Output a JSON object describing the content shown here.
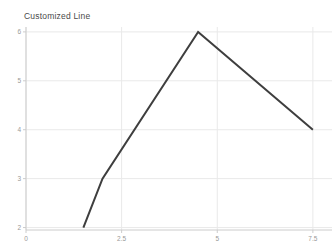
{
  "window": {
    "background": "#ffffff"
  },
  "chart_data": {
    "type": "line",
    "title": "Customized Line",
    "xlabel": "",
    "ylabel": "",
    "x": [
      1.5,
      2,
      4.5,
      7.5
    ],
    "series": [
      {
        "name": "Customized Line",
        "values": [
          2,
          3,
          6,
          4
        ],
        "color": "#3e3e3e",
        "stroke_width": 2
      }
    ],
    "xticks": [
      0,
      2.5,
      5,
      7.5
    ],
    "yticks": [
      2,
      3,
      4,
      5,
      6
    ],
    "xlim": [
      0,
      8
    ],
    "ylim": [
      1.95,
      6.1
    ],
    "grid": true,
    "legend_position": "none",
    "colors": {
      "grid": "#e9e9e9",
      "axis": "#cccccc",
      "tick_label": "#999999",
      "title": "#4a4a4a"
    }
  }
}
